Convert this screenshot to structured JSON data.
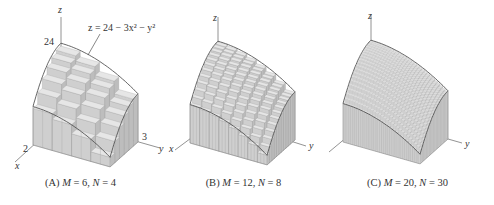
{
  "figure": {
    "equation": "z = 24 − 3x² − y²",
    "axis_labels": {
      "x": "x",
      "y": "y",
      "z": "z"
    },
    "ticks": {
      "z": "24",
      "x": "2",
      "y": "3"
    },
    "panels": [
      {
        "id": "A",
        "caption_prefix": "(A) ",
        "M_label": "M",
        "M": "6",
        "N_label": "N",
        "N": "4",
        "grid": [
          6,
          4
        ]
      },
      {
        "id": "B",
        "caption_prefix": "(B) ",
        "M_label": "M",
        "M": "12",
        "N_label": "N",
        "N": "8",
        "grid": [
          12,
          8
        ]
      },
      {
        "id": "C",
        "caption_prefix": "(C) ",
        "M_label": "M",
        "M": "20",
        "N_label": "N",
        "N": "30",
        "grid": [
          20,
          30
        ]
      }
    ],
    "colors": {
      "surface": "#d9d9d9",
      "side": "#c4c4c4",
      "edge": "#555555",
      "axis": "#777777"
    }
  }
}
